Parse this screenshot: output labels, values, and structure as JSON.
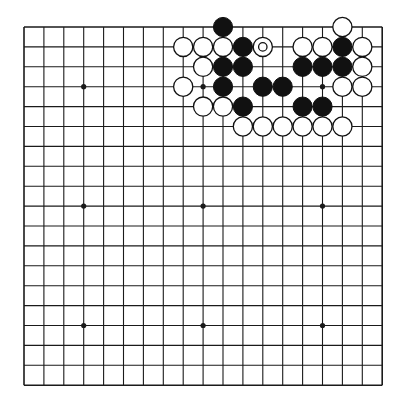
{
  "board": {
    "size": 19,
    "origin_x": 24,
    "origin_y": 27,
    "spacing": 19.9,
    "stone_radius": 9.6,
    "line_color": "#1a1a1a",
    "background": "#ffffff",
    "star_points": [
      [
        3,
        3
      ],
      [
        9,
        3
      ],
      [
        15,
        3
      ],
      [
        3,
        9
      ],
      [
        9,
        9
      ],
      [
        15,
        9
      ],
      [
        3,
        15
      ],
      [
        9,
        15
      ],
      [
        15,
        15
      ]
    ]
  },
  "stones": {
    "black": [
      [
        10,
        0
      ],
      [
        11,
        1
      ],
      [
        16,
        1
      ],
      [
        10,
        2
      ],
      [
        11,
        2
      ],
      [
        14,
        2
      ],
      [
        15,
        2
      ],
      [
        16,
        2
      ],
      [
        10,
        3
      ],
      [
        12,
        3
      ],
      [
        13,
        3
      ],
      [
        11,
        4
      ],
      [
        14,
        4
      ],
      [
        15,
        4
      ]
    ],
    "white": [
      [
        16,
        0
      ],
      [
        8,
        1
      ],
      [
        9,
        1
      ],
      [
        10,
        1
      ],
      [
        12,
        1
      ],
      [
        14,
        1
      ],
      [
        15,
        1
      ],
      [
        17,
        1
      ],
      [
        9,
        2
      ],
      [
        17,
        2
      ],
      [
        8,
        3
      ],
      [
        16,
        3
      ],
      [
        17,
        3
      ],
      [
        9,
        4
      ],
      [
        10,
        4
      ],
      [
        11,
        5
      ],
      [
        12,
        5
      ],
      [
        13,
        5
      ],
      [
        14,
        5
      ],
      [
        15,
        5
      ],
      [
        16,
        5
      ]
    ]
  },
  "marks": [
    {
      "type": "circle",
      "point": [
        12,
        1
      ],
      "on": "white"
    }
  ]
}
